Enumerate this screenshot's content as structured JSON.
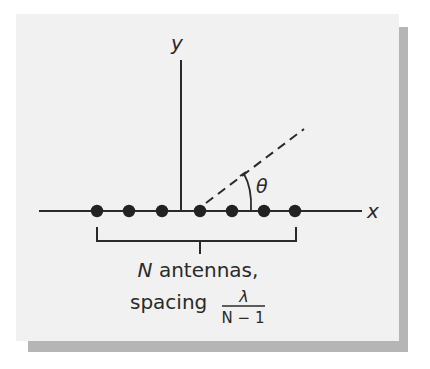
{
  "figure": {
    "axes": {
      "x_label": "x",
      "y_label": "y"
    },
    "angle": {
      "label": "θ"
    },
    "antennas": {
      "count_shown": 7,
      "x_positions": [
        97,
        129,
        162,
        200,
        232,
        264,
        295
      ]
    },
    "caption": {
      "line1_var": "N",
      "line1_text": " antennas,",
      "line2_text": "spacing",
      "fraction_numerator": "λ",
      "fraction_denominator": "N − 1"
    },
    "colors": {
      "panel": "#f1f1f1",
      "shadow": "#b5b5b5",
      "ink": "#2a2a2a"
    }
  }
}
